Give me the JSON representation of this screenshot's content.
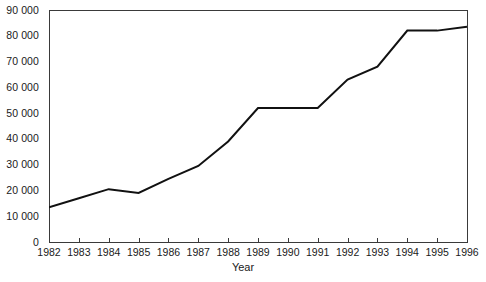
{
  "chart_data": {
    "type": "line",
    "title": "",
    "subtitle": "",
    "xlabel": "Year",
    "ylabel": "",
    "categories": [
      "1982",
      "1983",
      "1984",
      "1985",
      "1986",
      "1987",
      "1988",
      "1989",
      "1990",
      "1991",
      "1992",
      "1993",
      "1994",
      "1995",
      "1996"
    ],
    "x": [
      1982,
      1983,
      1984,
      1985,
      1986,
      1987,
      1988,
      1989,
      1990,
      1991,
      1992,
      1993,
      1994,
      1995,
      1996
    ],
    "values": [
      13500,
      17000,
      20500,
      19000,
      24500,
      29500,
      39000,
      52000,
      52000,
      52000,
      63000,
      68000,
      82000,
      82000,
      83500
    ],
    "series": [
      {
        "name": "",
        "values": [
          13500,
          17000,
          20500,
          19000,
          24500,
          29500,
          39000,
          52000,
          52000,
          52000,
          63000,
          68000,
          82000,
          82000,
          83500
        ],
        "color": "#111111"
      }
    ],
    "xlim": [
      1982,
      1996
    ],
    "ylim": [
      0,
      90000
    ],
    "ytick_labels": [
      "90 000",
      "80 000",
      "70 000",
      "60 000",
      "50 000",
      "40 000",
      "30 000",
      "20 000",
      "10 000",
      "0"
    ],
    "ytick_values": [
      90000,
      80000,
      70000,
      60000,
      50000,
      40000,
      30000,
      20000,
      10000,
      0
    ],
    "grid": false,
    "legend": false,
    "legend_position": "none",
    "frame": true,
    "line_color": "#111111",
    "axis_color": "#3a3a3a",
    "background_color": "#ffffff"
  }
}
